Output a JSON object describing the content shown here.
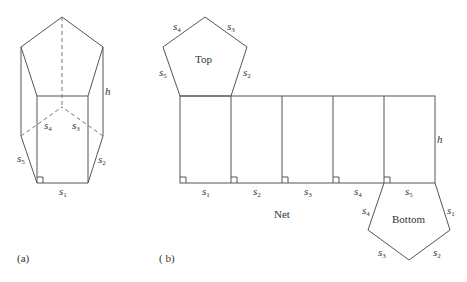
{
  "figure_a": {
    "caption": "(a)",
    "labels": {
      "s1": {
        "base": "s",
        "sub": "1"
      },
      "s2": {
        "base": "s",
        "sub": "2"
      },
      "s3": {
        "base": "s",
        "sub": "3"
      },
      "s4": {
        "base": "s",
        "sub": "4"
      },
      "s5": {
        "base": "s",
        "sub": "5"
      },
      "h": "h"
    }
  },
  "figure_b": {
    "caption": "( b)",
    "net_label": "Net",
    "top_label": "Top",
    "bottom_label": "Bottom",
    "top_edges": {
      "s2": {
        "base": "s",
        "sub": "2"
      },
      "s3": {
        "base": "s",
        "sub": "3"
      },
      "s4": {
        "base": "s",
        "sub": "4"
      },
      "s5": {
        "base": "s",
        "sub": "5"
      }
    },
    "rect_edges": [
      {
        "base": "s",
        "sub": "1"
      },
      {
        "base": "s",
        "sub": "2"
      },
      {
        "base": "s",
        "sub": "3"
      },
      {
        "base": "s",
        "sub": "4"
      },
      {
        "base": "s",
        "sub": "5"
      }
    ],
    "h": "h",
    "bottom_edges": {
      "s1": {
        "base": "s",
        "sub": "1"
      },
      "s2": {
        "base": "s",
        "sub": "2"
      },
      "s3": {
        "base": "s",
        "sub": "3"
      },
      "s4": {
        "base": "s",
        "sub": "4"
      }
    }
  }
}
